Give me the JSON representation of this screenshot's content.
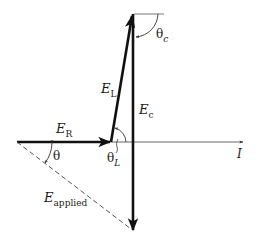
{
  "diagram": {
    "type": "phasor-diagram",
    "labels": {
      "E_R": {
        "main": "E",
        "sub": "R"
      },
      "E_L": {
        "main": "E",
        "sub": "L"
      },
      "E_c": {
        "main": "E",
        "sub": "c"
      },
      "E_applied": {
        "main": "E",
        "sub": "applied"
      },
      "I": "I",
      "theta": "θ",
      "theta_L": {
        "main": "θ",
        "sub": "L"
      },
      "theta_c": {
        "main": "θ",
        "sub": "c"
      }
    },
    "colors": {
      "stroke": "#111111",
      "axis": "#666666"
    }
  }
}
